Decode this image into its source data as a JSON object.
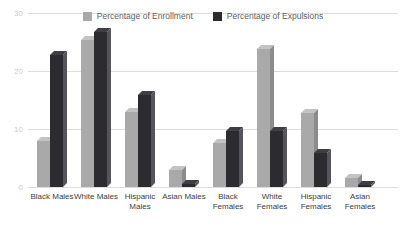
{
  "chart_data": {
    "type": "bar",
    "title": "",
    "xlabel": "",
    "ylabel": "",
    "categories": [
      "Black Males",
      "White Males",
      "Hispanic Males",
      "Asian Males",
      "Black Females",
      "White Females",
      "Hispanic Females",
      "Asian Females"
    ],
    "series": [
      {
        "name": "Percentage of Enrollment",
        "color": "#a9a9a9",
        "side_color": "#8c8c8c",
        "top_color": "#c3c3c3",
        "values": [
          8,
          25.4,
          13,
          2.9,
          7.6,
          23.8,
          12.7,
          1.5
        ]
      },
      {
        "name": "Percentage of Expulsions",
        "color": "#2b2b30",
        "side_color": "#55555b",
        "top_color": "#3e3e43",
        "values": [
          22.8,
          26.8,
          15.8,
          0.6,
          9.7,
          9.7,
          5.8,
          0.3
        ]
      }
    ],
    "ylim": [
      0,
      30
    ],
    "yticks": [
      0,
      10,
      20,
      30
    ],
    "grid": true,
    "legend_position": "top center"
  },
  "colors": {
    "background": "#ffffff",
    "gridline": "#dddddd",
    "y_tick_text": "#cccccc",
    "x_tick_text": "#3d3d3d",
    "legend_text": "#616161"
  }
}
